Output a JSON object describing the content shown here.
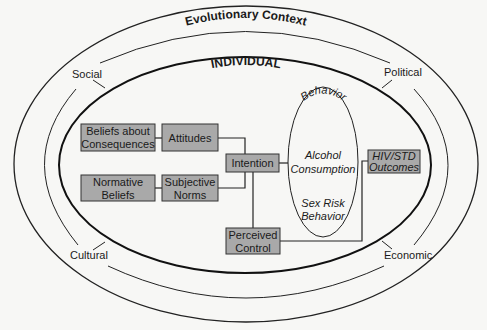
{
  "diagram": {
    "outer_title": "Evolutionary Context",
    "inner_title": "INDIVIDUAL",
    "context_labels": {
      "top_left": "Social",
      "top_right": "Political",
      "bottom_left": "Cultural",
      "bottom_right": "Economic"
    },
    "behavior": {
      "heading": "Behavior",
      "items": [
        "Alcohol",
        "Consumption",
        "Sex Risk",
        "Behavior"
      ]
    },
    "boxes": {
      "beliefs_consequences": [
        "Beliefs about",
        "Consequences"
      ],
      "attitudes": [
        "Attitudes"
      ],
      "normative_beliefs": [
        "Normative",
        "Beliefs"
      ],
      "subjective_norms": [
        "Subjective",
        "Norms"
      ],
      "intention": [
        "Intention"
      ],
      "perceived_control": [
        "Perceived",
        "Control"
      ],
      "outcomes": [
        "HIV/STD",
        "Outcomes"
      ]
    },
    "colors": {
      "box_fill": "#a9a9a9",
      "line": "#222222",
      "background": "#f7f7f5"
    }
  }
}
